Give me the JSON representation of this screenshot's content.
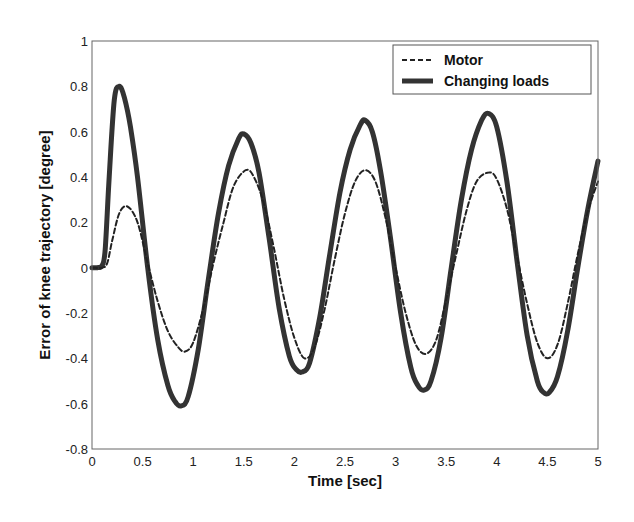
{
  "chart_data": {
    "type": "line",
    "title": "",
    "xlabel": "Time [sec]",
    "ylabel": "Error of knee trajectory [degree]",
    "xlim": [
      0,
      5
    ],
    "ylim": [
      -0.8,
      1
    ],
    "xticks": [
      0,
      0.5,
      1,
      1.5,
      2,
      2.5,
      3,
      3.5,
      4,
      4.5,
      5
    ],
    "xtick_labels": [
      "0",
      "0.5",
      "1",
      "1.5",
      "2",
      "2.5",
      "3",
      "3.5",
      "4",
      "4.5",
      "5"
    ],
    "yticks": [
      -0.8,
      -0.6,
      -0.4,
      -0.2,
      0,
      0.2,
      0.4,
      0.6,
      0.8,
      1
    ],
    "ytick_labels": [
      "-0.8",
      "-0.6",
      "-0.4",
      "-0.2",
      "0",
      "0.2",
      "0.4",
      "0.6",
      "0.8",
      "1"
    ],
    "grid": true,
    "legend_position": "upper right",
    "series": [
      {
        "name": "Motor",
        "style": "dashed",
        "color": "#222222",
        "x": [
          0,
          0.1,
          0.15,
          0.2,
          0.27,
          0.35,
          0.45,
          0.55,
          0.65,
          0.75,
          0.85,
          0.92,
          1.0,
          1.1,
          1.2,
          1.3,
          1.4,
          1.52,
          1.6,
          1.7,
          1.8,
          1.9,
          2.0,
          2.1,
          2.2,
          2.3,
          2.4,
          2.5,
          2.6,
          2.7,
          2.8,
          2.9,
          3.0,
          3.1,
          3.2,
          3.3,
          3.4,
          3.5,
          3.6,
          3.7,
          3.8,
          3.92,
          4.0,
          4.1,
          4.2,
          4.3,
          4.4,
          4.5,
          4.6,
          4.7,
          4.8,
          4.9,
          5.0
        ],
        "y": [
          0,
          0,
          0.02,
          0.12,
          0.24,
          0.27,
          0.2,
          0.02,
          -0.15,
          -0.28,
          -0.35,
          -0.37,
          -0.33,
          -0.18,
          0.02,
          0.2,
          0.36,
          0.43,
          0.4,
          0.28,
          0.08,
          -0.14,
          -0.31,
          -0.4,
          -0.35,
          -0.18,
          0.04,
          0.24,
          0.38,
          0.43,
          0.38,
          0.22,
          0.0,
          -0.2,
          -0.34,
          -0.38,
          -0.32,
          -0.14,
          0.06,
          0.25,
          0.38,
          0.42,
          0.39,
          0.26,
          0.05,
          -0.16,
          -0.33,
          -0.4,
          -0.34,
          -0.16,
          0.06,
          0.25,
          0.38
        ]
      },
      {
        "name": "Changing loads",
        "style": "solid-thick",
        "color": "#333333",
        "x": [
          0,
          0.05,
          0.1,
          0.13,
          0.17,
          0.22,
          0.27,
          0.32,
          0.38,
          0.45,
          0.55,
          0.65,
          0.75,
          0.82,
          0.88,
          0.95,
          1.05,
          1.15,
          1.25,
          1.35,
          1.45,
          1.5,
          1.57,
          1.65,
          1.75,
          1.85,
          1.95,
          2.02,
          2.08,
          2.15,
          2.25,
          2.35,
          2.45,
          2.55,
          2.65,
          2.7,
          2.77,
          2.85,
          2.95,
          3.05,
          3.15,
          3.22,
          3.28,
          3.35,
          3.45,
          3.55,
          3.65,
          3.75,
          3.85,
          3.92,
          4.0,
          4.1,
          4.2,
          4.3,
          4.4,
          4.46,
          4.52,
          4.6,
          4.7,
          4.8,
          4.9,
          5.0
        ],
        "y": [
          0,
          0,
          0.01,
          0.08,
          0.4,
          0.74,
          0.8,
          0.75,
          0.62,
          0.4,
          0.0,
          -0.32,
          -0.52,
          -0.59,
          -0.61,
          -0.57,
          -0.36,
          -0.05,
          0.24,
          0.45,
          0.57,
          0.59,
          0.55,
          0.42,
          0.13,
          -0.18,
          -0.39,
          -0.45,
          -0.46,
          -0.42,
          -0.22,
          0.06,
          0.33,
          0.52,
          0.63,
          0.65,
          0.6,
          0.43,
          0.13,
          -0.2,
          -0.44,
          -0.52,
          -0.54,
          -0.5,
          -0.31,
          0.0,
          0.3,
          0.52,
          0.65,
          0.68,
          0.62,
          0.38,
          0.03,
          -0.3,
          -0.5,
          -0.55,
          -0.55,
          -0.48,
          -0.28,
          0.0,
          0.26,
          0.47
        ]
      }
    ]
  },
  "axes": {
    "xlabel": "Time [sec]",
    "ylabel": "Error of knee trajectory [degree]"
  },
  "legend": {
    "items": [
      {
        "label": "Motor",
        "style": "dashed"
      },
      {
        "label": "Changing loads",
        "style": "solid-thick"
      }
    ]
  }
}
